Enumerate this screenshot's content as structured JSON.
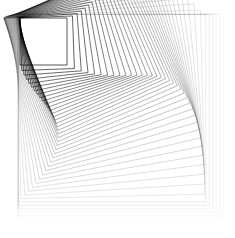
{
  "artwork": {
    "kind": "nested-rotating-squares",
    "background": "#ffffff",
    "stroke_color": "#000000",
    "count": 42,
    "size_start": 47,
    "size_end": 205,
    "anchor_start": [
      20,
      18
    ],
    "anchor_end": [
      18,
      14
    ],
    "angle_peak_deg": 24,
    "opacity_start": 0.95,
    "opacity_end": 0.04,
    "stroke_width": 0.7
  }
}
